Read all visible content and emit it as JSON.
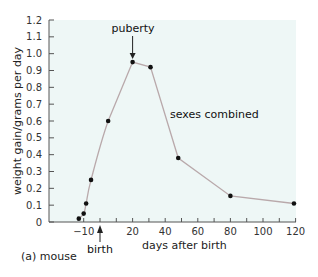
{
  "chart_data": {
    "type": "line",
    "title": "",
    "caption": "(a) mouse",
    "xlabel": "days after birth",
    "ylabel": "weight gain/grams per day",
    "xlim": [
      -15,
      120
    ],
    "ylim": [
      0,
      1.2
    ],
    "x_ticks": [
      -10,
      20,
      40,
      60,
      80,
      100,
      120
    ],
    "x_minor_ticks": [
      0,
      10,
      30,
      50,
      70,
      90,
      110
    ],
    "y_ticks": [
      0,
      0.1,
      0.2,
      0.3,
      0.4,
      0.5,
      0.6,
      0.7,
      0.8,
      0.9,
      1.0,
      1.1,
      1.2
    ],
    "y_tick_labels": [
      "0",
      "0.1",
      "0.2",
      "0.3",
      "0.4",
      "0.5",
      "0.6",
      "0.7",
      "0.8",
      "0.9",
      "1.0",
      "1.1",
      "1.2"
    ],
    "grid": false,
    "series": [
      {
        "name": "sexes combined",
        "x": [
          -13,
          -10,
          -8.5,
          -5.5,
          5,
          20,
          31,
          48,
          80,
          119
        ],
        "values": [
          0.02,
          0.05,
          0.11,
          0.25,
          0.6,
          0.95,
          0.92,
          0.38,
          0.155,
          0.11
        ]
      }
    ],
    "annotations": [
      {
        "text": "puberty",
        "x": 20,
        "arrow_to_y": 0.95
      },
      {
        "text": "birth",
        "x": 0,
        "arrow_from_below": true
      },
      {
        "text": "sexes combined",
        "x": 42,
        "y": 0.63
      }
    ],
    "colors": {
      "plot_bg": "#eef7f6",
      "line": "#b9a9ab",
      "marker": "#111111",
      "axis": "#555555"
    }
  }
}
